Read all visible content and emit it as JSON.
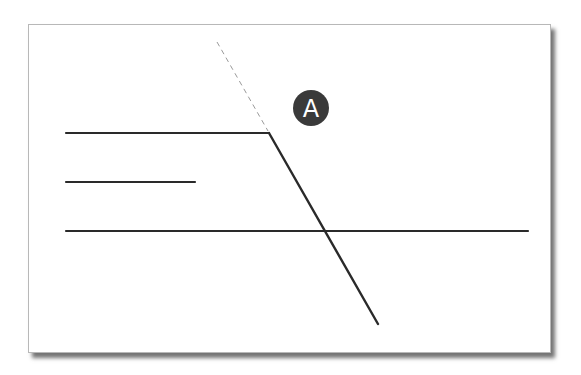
{
  "diagram": {
    "type": "geometry-lines",
    "colors": {
      "line": "#2a2a2a",
      "dashed_line": "#9a9a9a",
      "badge_fill": "#3a3a3a",
      "badge_text": "#ffffff",
      "card_background": "#ffffff",
      "card_border": "#b8b8b8"
    },
    "lines": [
      {
        "id": "line-top",
        "x1": 66,
        "y1": 133,
        "x2": 269,
        "y2": 133,
        "style": "solid"
      },
      {
        "id": "line-middle-short",
        "x1": 66,
        "y1": 182,
        "x2": 195,
        "y2": 182,
        "style": "solid"
      },
      {
        "id": "line-bottom-long",
        "x1": 66,
        "y1": 231,
        "x2": 528,
        "y2": 231,
        "style": "solid"
      },
      {
        "id": "line-diagonal",
        "x1": 269,
        "y1": 133,
        "x2": 378,
        "y2": 324,
        "style": "solid"
      },
      {
        "id": "line-diagonal-extension",
        "x1": 217,
        "y1": 42,
        "x2": 268,
        "y2": 131,
        "style": "dashed"
      }
    ],
    "badge": {
      "label": "A",
      "cx": 311,
      "cy": 108,
      "r": 18
    }
  }
}
